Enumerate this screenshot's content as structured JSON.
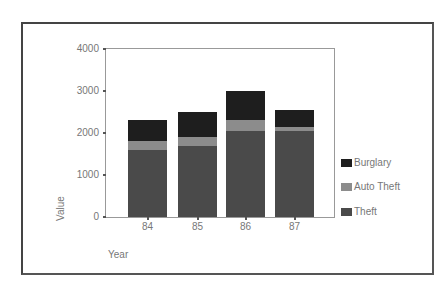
{
  "chart_data": {
    "type": "bar",
    "stacked": true,
    "title": "",
    "xlabel": "Year",
    "ylabel": "Value",
    "categories": [
      "84",
      "85",
      "86",
      "87"
    ],
    "series": [
      {
        "name": "Theft",
        "color": "#4a4a4a",
        "values": [
          1600,
          1700,
          2050,
          2050
        ]
      },
      {
        "name": "Auto Theft",
        "color": "#8c8c8c",
        "values": [
          200,
          200,
          250,
          100
        ]
      },
      {
        "name": "Burglary",
        "color": "#1e1e1e",
        "values": [
          500,
          600,
          700,
          400
        ]
      }
    ],
    "ylim": [
      0,
      4000
    ],
    "yticks": [
      0,
      1000,
      2000,
      3000,
      4000
    ],
    "grid": false,
    "legend": {
      "position": "right",
      "entries": [
        "Burglary",
        "Auto Theft",
        "Theft"
      ]
    }
  }
}
